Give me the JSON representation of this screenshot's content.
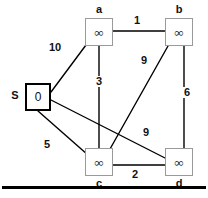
{
  "figure": {
    "kind": "weighted-undirected-graph",
    "width": 208,
    "height": 198,
    "background": "#ffffff",
    "edge_color": "#000000",
    "node_border_color": "#9a9a9a",
    "source_border_color": "#000000"
  },
  "nodes": [
    {
      "id": "s",
      "label": "S",
      "value": "0",
      "label_pos": "left",
      "x": 25,
      "y": 83,
      "w": 26,
      "h": 28,
      "source": true
    },
    {
      "id": "a",
      "label": "a",
      "value": "∞",
      "label_pos": "top",
      "x": 85,
      "y": 18,
      "w": 28,
      "h": 28,
      "source": false
    },
    {
      "id": "b",
      "label": "b",
      "value": "∞",
      "label_pos": "top",
      "x": 165,
      "y": 18,
      "w": 28,
      "h": 28,
      "source": false
    },
    {
      "id": "c",
      "label": "c",
      "value": "∞",
      "label_pos": "bottom",
      "x": 85,
      "y": 148,
      "w": 28,
      "h": 28,
      "source": false
    },
    {
      "id": "d",
      "label": "d",
      "value": "∞",
      "label_pos": "bottom",
      "x": 165,
      "y": 148,
      "w": 28,
      "h": 28,
      "source": false
    }
  ],
  "edges": [
    {
      "from": "s",
      "to": "a",
      "weight": "10",
      "x1": 51,
      "y1": 92,
      "x2": 86,
      "y2": 45,
      "lx": 48,
      "ly": 42
    },
    {
      "from": "a",
      "to": "b",
      "weight": "1",
      "x1": 113,
      "y1": 31,
      "x2": 165,
      "y2": 31,
      "lx": 133,
      "ly": 16
    },
    {
      "from": "a",
      "to": "c",
      "weight": "3",
      "x1": 99,
      "y1": 46,
      "x2": 99,
      "y2": 148,
      "lx": 96,
      "ly": 76
    },
    {
      "from": "b",
      "to": "c",
      "weight": "9",
      "x1": 168,
      "y1": 46,
      "x2": 110,
      "y2": 149,
      "lx": 140,
      "ly": 55
    },
    {
      "from": "b",
      "to": "d",
      "weight": "6",
      "x1": 184,
      "y1": 46,
      "x2": 184,
      "y2": 148,
      "lx": 183,
      "ly": 87
    },
    {
      "from": "s",
      "to": "d",
      "weight": "9",
      "x1": 51,
      "y1": 100,
      "x2": 165,
      "y2": 158,
      "lx": 142,
      "ly": 127
    },
    {
      "from": "s",
      "to": "c",
      "weight": "5",
      "x1": 38,
      "y1": 111,
      "x2": 88,
      "y2": 155,
      "lx": 43,
      "ly": 139
    },
    {
      "from": "c",
      "to": "d",
      "weight": "2",
      "x1": 113,
      "y1": 165,
      "x2": 165,
      "y2": 165,
      "lx": 131,
      "ly": 169
    }
  ],
  "rule": {
    "present": true
  }
}
